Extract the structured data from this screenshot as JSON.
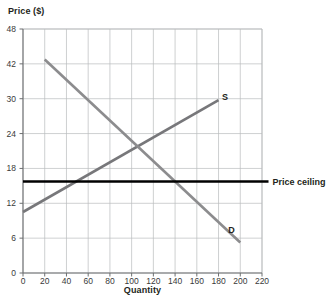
{
  "chart_data": {
    "type": "line",
    "title": "",
    "xlabel": "Quantity",
    "ylabel": "Price ($)",
    "xlim": [
      0,
      220
    ],
    "ylim": [
      0,
      48
    ],
    "grid": true,
    "legend": "inline-curve-labels",
    "x_ticks": [
      0,
      20,
      40,
      60,
      80,
      100,
      120,
      140,
      160,
      180,
      200,
      220
    ],
    "x_tick_labels": [
      "0",
      "20",
      "40",
      "60",
      "80",
      "100",
      "120",
      "140",
      "160",
      "180",
      "200",
      "220"
    ],
    "y_tick_labels": [
      "48",
      "42",
      "30",
      "24",
      "18",
      "12",
      "6",
      "0"
    ],
    "y_tick_positions": [
      48,
      42,
      36,
      30,
      24,
      18,
      12,
      6
    ],
    "series": [
      {
        "name": "S",
        "label": "S",
        "role": "supply",
        "color": "#77777a",
        "label_point": {
          "x": 186,
          "y": 34.6
        },
        "points": [
          {
            "x": 0,
            "y": 12
          },
          {
            "x": 180,
            "y": 34
          }
        ]
      },
      {
        "name": "D",
        "label": "D",
        "role": "demand",
        "color": "#8c8c8e",
        "label_point": {
          "x": 192,
          "y": 8.4
        },
        "points": [
          {
            "x": 20,
            "y": 42
          },
          {
            "x": 200,
            "y": 6
          }
        ]
      }
    ],
    "annotations": [
      {
        "name": "price-ceiling",
        "label": "Price ceiling",
        "type": "hline",
        "value": 18,
        "color": "#000000",
        "x_start": 0,
        "x_end": 226
      }
    ],
    "equilibrium": {
      "x": 100,
      "y": 23.5
    },
    "shortage": {
      "qd": 128,
      "qs": 50,
      "price": 18
    }
  },
  "colors": {
    "background": "#ffffff",
    "grid": "#b9bbbd",
    "axis": "#6d6f71",
    "text": "#231f20",
    "supply": "#77777a",
    "demand": "#8c8c8e",
    "ceiling": "#000000"
  }
}
